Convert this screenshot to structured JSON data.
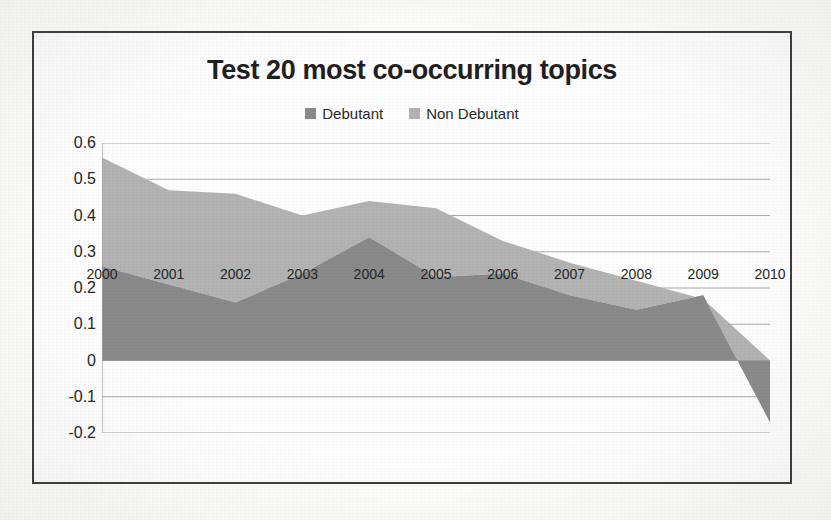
{
  "page": {
    "background_color": "#fdfdfc",
    "frame_border_color": "#3b3b3b",
    "bleed_through_text": "Test 20 most co-occurring topics",
    "bleed_through_text_2": "Debutant    Non Debutant"
  },
  "chart_data": {
    "type": "area",
    "stacked": true,
    "title": "Test 20 most co-occurring topics",
    "xlabel": "",
    "ylabel": "",
    "categories": [
      "2000",
      "2001",
      "2002",
      "2003",
      "2004",
      "2005",
      "2006",
      "2007",
      "2008",
      "2009",
      "2010"
    ],
    "ylim": [
      -0.2,
      0.6
    ],
    "yticks": [
      "0.6",
      "0.5",
      "0.4",
      "0.3",
      "0.2",
      "0.1",
      "0",
      "-0.1",
      "-0.2"
    ],
    "ytick_values": [
      0.6,
      0.5,
      0.4,
      0.3,
      0.2,
      0.1,
      0,
      -0.1,
      -0.2
    ],
    "grid": true,
    "grid_color": "#8f8f8f",
    "legend_position": "top",
    "series": [
      {
        "name": "Debutant",
        "color": "#8a8a8a",
        "values": [
          0.26,
          0.21,
          0.16,
          0.24,
          0.34,
          0.23,
          0.24,
          0.18,
          0.14,
          0.18,
          -0.17
        ]
      },
      {
        "name": "Non Debutant",
        "color": "#b3b3b3",
        "values": [
          0.3,
          0.26,
          0.3,
          0.16,
          0.1,
          0.19,
          0.09,
          0.09,
          0.08,
          -0.01,
          0.17
        ]
      }
    ],
    "stacked_totals": [
      0.56,
      0.47,
      0.46,
      0.4,
      0.44,
      0.42,
      0.33,
      0.27,
      0.22,
      0.17,
      0.0
    ]
  },
  "legend": {
    "items": [
      {
        "label": "Debutant",
        "color": "#8a8a8a"
      },
      {
        "label": "Non Debutant",
        "color": "#b3b3b3"
      }
    ]
  }
}
